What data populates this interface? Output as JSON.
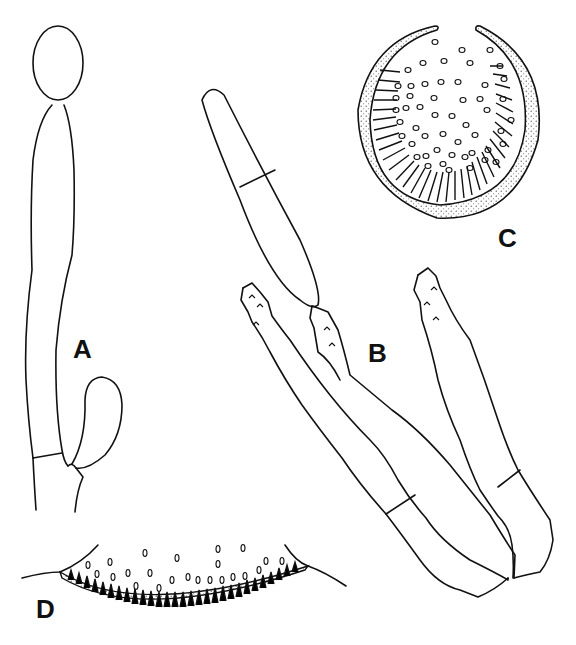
{
  "figure": {
    "panels": [
      {
        "id": "A",
        "label": "A",
        "description": "hypha with terminal spore and lateral swollen cell"
      },
      {
        "id": "B",
        "label": "B",
        "description": "elongate septate cell attached to two spiny-tipped clavate cells and a third cell"
      },
      {
        "id": "C",
        "label": "C",
        "description": "cross-section of spherical fruiting body with stippled wall, radial palisade and scattered spores"
      },
      {
        "id": "D",
        "label": "D",
        "description": "section of cup-shaped hymenial layer with palisade and scattered spores"
      }
    ],
    "colors": {
      "ink": "#111111",
      "paper": "#ffffff"
    }
  }
}
